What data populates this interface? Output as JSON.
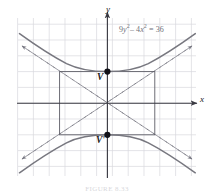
{
  "figure": {
    "kind": "hyperbola-graph",
    "background": "#ffffff"
  },
  "axes": {
    "x_label": "x",
    "y_label": "y",
    "origin_px": [
      107,
      103
    ],
    "grid_step_px": 15.8,
    "grid_color": "#d9d9de",
    "axis_color": "#3a3a42",
    "x_range": [
      -6,
      6.5
    ],
    "y_range": [
      -5.5,
      5.5
    ]
  },
  "equation": {
    "text": "9y2 - 4x2 = 36",
    "color": "#6f6f78",
    "parts": {
      "c1": "9",
      "v1": "y",
      "e1": "2",
      "op1": "– ",
      "c2": "4",
      "v2": "x",
      "e2": "2",
      "eq": " = 36"
    }
  },
  "vertices": [
    {
      "name": "upper-vertex",
      "label": "V",
      "value": [
        0,
        2
      ],
      "px": [
        107,
        70
      ]
    },
    {
      "name": "lower-vertex",
      "label": "V'",
      "value": [
        0,
        -2
      ],
      "px": [
        107,
        134
      ]
    }
  ],
  "curve": {
    "name": "hyperbola",
    "color": "#77777f",
    "a": 2,
    "b": 3,
    "orientation": "vertical"
  },
  "asymptotes": {
    "color": "#7a7a84",
    "style": "dashed",
    "slopes": [
      0.6666,
      -0.6666
    ],
    "arrowheads": 4
  },
  "central_rectangle": {
    "name": "fundamental-rectangle",
    "color": "#5d5d66",
    "x_half_width": 3,
    "y_half_height": 2,
    "px_rect": [
      60,
      70,
      95,
      64
    ]
  },
  "caption": {
    "text": "FIGURE 8.33"
  },
  "colors": {
    "grid": "#d9d9de",
    "axis": "#3a3a42",
    "curve": "#77777f",
    "asymptote": "#7a7a84",
    "rectangle": "#5d5d66",
    "label": "#1a1a1a",
    "equation": "#6f6f78"
  }
}
